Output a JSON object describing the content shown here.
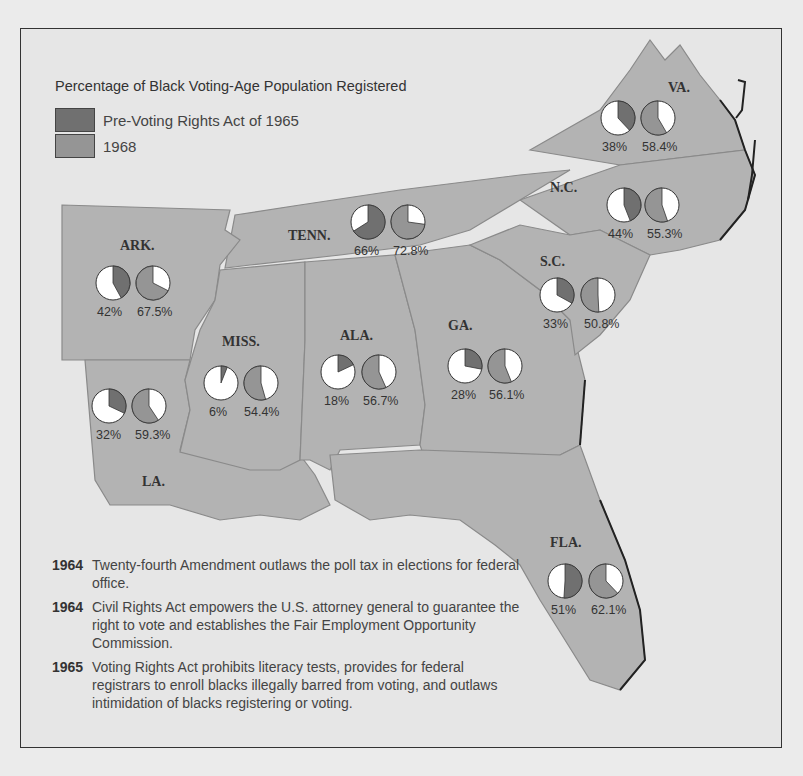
{
  "legend": {
    "title": "Percentage of Black Voting-Age Population Registered",
    "items": [
      {
        "label": "Pre-Voting Rights Act of 1965",
        "color": "#707070"
      },
      {
        "label": "1968",
        "color": "#959595"
      }
    ]
  },
  "colors": {
    "land": "#b3b3b3",
    "background": "#e6e6e6",
    "pre_1965": "#707070",
    "y1968": "#959595",
    "unregistered": "#ffffff"
  },
  "states": [
    {
      "name": "VA.",
      "pre": "38%",
      "post": "58.4%"
    },
    {
      "name": "N.C.",
      "pre": "44%",
      "post": "55.3%"
    },
    {
      "name": "TENN.",
      "pre": "66%",
      "post": "72.8%"
    },
    {
      "name": "ARK.",
      "pre": "42%",
      "post": "67.5%"
    },
    {
      "name": "S.C.",
      "pre": "33%",
      "post": "50.8%"
    },
    {
      "name": "MISS.",
      "pre": "6%",
      "post": "54.4%"
    },
    {
      "name": "ALA.",
      "pre": "18%",
      "post": "56.7%"
    },
    {
      "name": "GA.",
      "pre": "28%",
      "post": "56.1%"
    },
    {
      "name": "LA.",
      "pre": "32%",
      "post": "59.3%"
    },
    {
      "name": "FLA.",
      "pre": "51%",
      "post": "62.1%"
    }
  ],
  "chart_data": {
    "type": "pie",
    "title": "Percentage of Black Voting-Age Population Registered",
    "series": [
      {
        "name": "Pre-Voting Rights Act of 1965",
        "values": {
          "VA.": 38,
          "N.C.": 44,
          "TENN.": 66,
          "ARK.": 42,
          "S.C.": 33,
          "MISS.": 6,
          "ALA.": 18,
          "GA.": 28,
          "LA.": 32,
          "FLA.": 51
        }
      },
      {
        "name": "1968",
        "values": {
          "VA.": 58.4,
          "N.C.": 55.3,
          "TENN.": 72.8,
          "ARK.": 67.5,
          "S.C.": 50.8,
          "MISS.": 54.4,
          "ALA.": 56.7,
          "GA.": 56.1,
          "LA.": 59.3,
          "FLA.": 62.1
        }
      }
    ],
    "categories": [
      "VA.",
      "N.C.",
      "TENN.",
      "ARK.",
      "S.C.",
      "MISS.",
      "ALA.",
      "GA.",
      "LA.",
      "FLA."
    ]
  },
  "events": [
    {
      "year": "1964",
      "text": "Twenty-fourth Amendment outlaws the poll tax in elections for federal office."
    },
    {
      "year": "1964",
      "text": "Civil Rights Act empowers the U.S. attorney general to guarantee the right to vote and establishes the Fair Employment Opportunity Commission."
    },
    {
      "year": "1965",
      "text": "Voting Rights Act prohibits literacy tests, provides for federal registrars to enroll blacks illegally barred from voting, and outlaws intimidation of blacks registering or voting."
    }
  ]
}
